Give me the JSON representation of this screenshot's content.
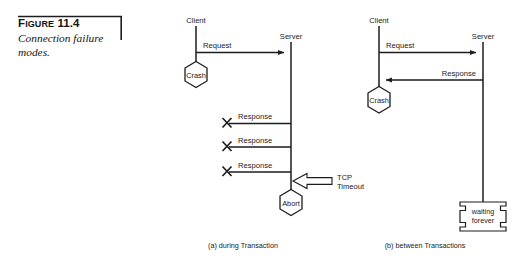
{
  "figure": {
    "label_prefix": "F",
    "label_rest": "IGURE",
    "number": "11.4",
    "caption_line1": "Connection failure",
    "caption_line2": "modes."
  },
  "panels": [
    {
      "id": "during-transaction",
      "sub_caption": "(a) during Transaction",
      "actors": [
        {
          "name": "client",
          "label": "Client"
        },
        {
          "name": "server",
          "label": "Server"
        }
      ],
      "messages": [
        {
          "name": "request",
          "label": "Request",
          "direction": "right",
          "blocked": false
        },
        {
          "name": "response-1",
          "label": "Response",
          "direction": "left",
          "blocked": true
        },
        {
          "name": "response-2",
          "label": "Response",
          "direction": "left",
          "blocked": true
        },
        {
          "name": "response-3",
          "label": "Response",
          "direction": "left",
          "blocked": true
        }
      ],
      "nodes": [
        {
          "name": "crash",
          "label": "Crash",
          "shape": "hexagon",
          "on": "client"
        },
        {
          "name": "abort",
          "label": "Abort",
          "shape": "hexagon",
          "on": "server"
        }
      ],
      "annotations": [
        {
          "name": "tcp-timeout",
          "line1": "TCP",
          "line2": "Timeout",
          "shape": "block-arrow-left"
        }
      ]
    },
    {
      "id": "between-transactions",
      "sub_caption": "(b) between Transactions",
      "actors": [
        {
          "name": "client",
          "label": "Client"
        },
        {
          "name": "server",
          "label": "Server"
        }
      ],
      "messages": [
        {
          "name": "request",
          "label": "Request",
          "direction": "right",
          "blocked": false
        },
        {
          "name": "response",
          "label": "Response",
          "direction": "left",
          "blocked": false
        }
      ],
      "nodes": [
        {
          "name": "crash",
          "label": "Crash",
          "shape": "hexagon",
          "on": "client"
        },
        {
          "name": "waiting-forever",
          "line1": "waiting",
          "line2": "forever",
          "shape": "delay-box",
          "on": "server"
        }
      ],
      "annotations": []
    }
  ],
  "colors": {
    "ink": "#1d1d1d",
    "rule": "#9a9a9a",
    "background": "#ffffff"
  }
}
